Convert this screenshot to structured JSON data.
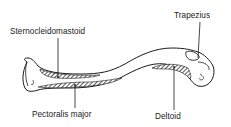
{
  "diagram": {
    "labels": [
      {
        "id": "sternocleidomastoid",
        "text": "Sternocleidomastoid"
      },
      {
        "id": "trapezius",
        "text": "Trapezius"
      },
      {
        "id": "pectoralis_major",
        "text": "Pectoralis major"
      },
      {
        "id": "deltoid",
        "text": "Deltoid"
      }
    ],
    "colors": {
      "line": "#1a1a1a",
      "background": "#ffffff",
      "hatch": "#222222"
    }
  }
}
